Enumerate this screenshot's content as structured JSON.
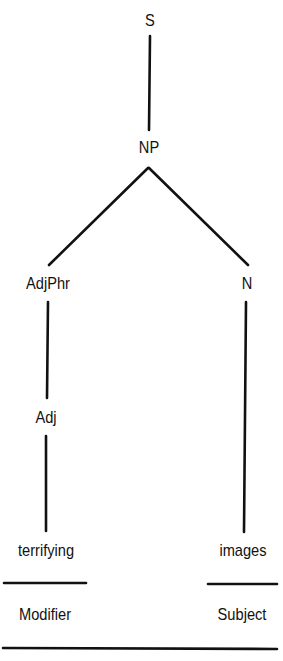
{
  "diagram": {
    "type": "syntax-tree",
    "colors": {
      "ink": "#111111",
      "background": "#ffffff"
    },
    "nodes": {
      "s": {
        "label": "S"
      },
      "np": {
        "label": "NP"
      },
      "adjphr": {
        "label": "AdjPhr"
      },
      "n": {
        "label": "N"
      },
      "adj": {
        "label": "Adj"
      }
    },
    "edges": [
      {
        "from": "S",
        "to": "NP"
      },
      {
        "from": "NP",
        "to": "AdjPhr"
      },
      {
        "from": "NP",
        "to": "N"
      },
      {
        "from": "AdjPhr",
        "to": "Adj"
      },
      {
        "from": "Adj",
        "to": "terrifying"
      },
      {
        "from": "N",
        "to": "images"
      }
    ],
    "leaves": {
      "left": {
        "word": "terrifying",
        "function": "Modifier"
      },
      "right": {
        "word": "images",
        "function": "Subject"
      }
    }
  }
}
